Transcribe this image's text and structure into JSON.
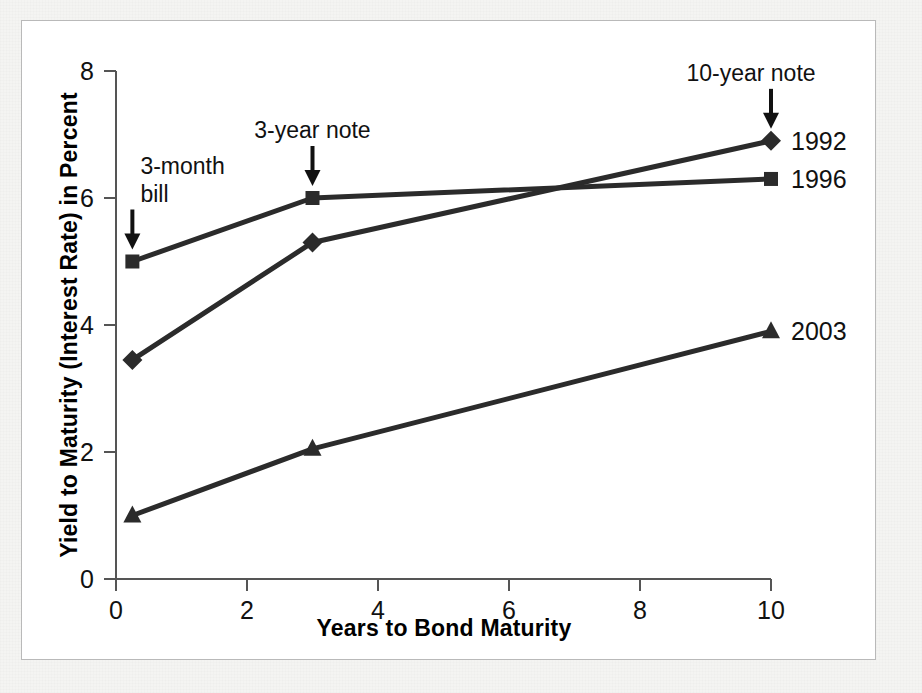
{
  "figure": {
    "panel_background": "#ffffff",
    "ink_color": "#2b2b2b"
  },
  "chart_data": {
    "type": "line",
    "title": "",
    "xlabel": "Years to Bond Maturity",
    "ylabel": "Yield to Maturity (Interest Rate) in Percent",
    "xlim": [
      0,
      10
    ],
    "ylim": [
      0,
      8
    ],
    "xticks": [
      "0",
      "2",
      "4",
      "6",
      "8",
      "10"
    ],
    "xtick_values": [
      0,
      2,
      4,
      6,
      8,
      10
    ],
    "yticks": [
      "0",
      "2",
      "4",
      "6",
      "8"
    ],
    "ytick_values": [
      0,
      2,
      4,
      6,
      8
    ],
    "grid": false,
    "legend_position": "right-of-line-ends",
    "x": [
      0.25,
      3,
      10
    ],
    "series": [
      {
        "name": "1992",
        "marker": "diamond",
        "values": [
          3.45,
          5.3,
          6.9
        ]
      },
      {
        "name": "1996",
        "marker": "square",
        "values": [
          5.0,
          6.0,
          6.3
        ]
      },
      {
        "name": "2003",
        "marker": "triangle",
        "values": [
          1.0,
          2.05,
          3.9
        ]
      }
    ],
    "annotations": [
      {
        "name": "3-month-bill",
        "lines": [
          "3-month",
          "bill"
        ],
        "points_to_x": 0.25,
        "points_to_y": 5.0
      },
      {
        "name": "3-year-note",
        "lines": [
          "3-year note"
        ],
        "points_to_x": 3,
        "points_to_y": 6.0
      },
      {
        "name": "10-year-note",
        "lines": [
          "10-year note"
        ],
        "points_to_x": 10,
        "points_to_y": 6.9
      }
    ]
  }
}
